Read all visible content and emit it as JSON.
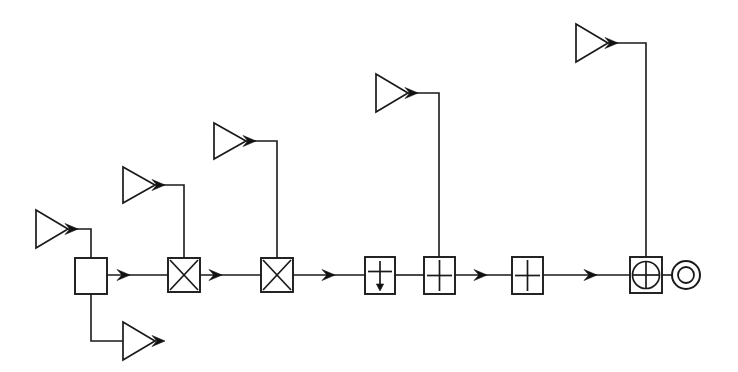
{
  "diagram": {
    "canvas": {
      "width": 738,
      "height": 372
    },
    "colors": {
      "background": "#ffffff",
      "line": "#1a1a1a",
      "arrow_fill": "#111111",
      "block_fill": "#ffffff"
    },
    "style": "line-art schematic, black on white, scanned appearance",
    "main_path_y": 275,
    "blocks": [
      {
        "id": "combiner",
        "name": "combiner-block",
        "symbol": "empty-square",
        "label": "",
        "x": 75,
        "y": 258,
        "w": 32,
        "h": 36,
        "inputs": [
          "top",
          "bottom"
        ],
        "outputs": [
          "right"
        ]
      },
      {
        "id": "mixer-1",
        "name": "mixer-block-1",
        "symbol": "cross-in-square",
        "label": "",
        "x": 168,
        "y": 258,
        "w": 32,
        "h": 34,
        "inputs": [
          "left",
          "top"
        ],
        "outputs": [
          "right"
        ]
      },
      {
        "id": "mixer-2",
        "name": "mixer-block-2",
        "symbol": "cross-in-square",
        "label": "",
        "x": 261,
        "y": 258,
        "w": 32,
        "h": 34,
        "inputs": [
          "left",
          "top"
        ],
        "outputs": [
          "right"
        ]
      },
      {
        "id": "decimator",
        "name": "downsampler-block",
        "symbol": "down-arrow-in-square",
        "label": "",
        "x": 365,
        "y": 257,
        "w": 30,
        "h": 37,
        "inputs": [
          "left"
        ],
        "outputs": [
          "right"
        ]
      },
      {
        "id": "adder-1",
        "name": "adder-block-1",
        "symbol": "plus-in-square",
        "label": "",
        "x": 424,
        "y": 257,
        "w": 31,
        "h": 37,
        "inputs": [
          "left",
          "top"
        ],
        "outputs": [
          "right"
        ]
      },
      {
        "id": "adder-2",
        "name": "adder-block-2",
        "symbol": "plus-in-square",
        "label": "",
        "x": 512,
        "y": 257,
        "w": 31,
        "h": 37,
        "inputs": [
          "left"
        ],
        "outputs": [
          "right"
        ]
      },
      {
        "id": "modulator",
        "name": "modulator-block",
        "symbol": "circle-cross-in-square",
        "label": "",
        "x": 630,
        "y": 257,
        "w": 32,
        "h": 36,
        "inputs": [
          "left",
          "top"
        ],
        "outputs": [
          "right"
        ]
      }
    ],
    "amplifiers": [
      {
        "id": "amp-1",
        "name": "amplifier-1",
        "symbol": "triangle-right",
        "label": "",
        "tip_x": 68,
        "tip_y": 229,
        "back_x": 36,
        "half_h": 19,
        "route": "right-then-down",
        "corner_x": 91,
        "target_y": 258
      },
      {
        "id": "amp-2",
        "name": "amplifier-2",
        "symbol": "triangle-right",
        "label": "",
        "tip_x": 155,
        "tip_y": 341,
        "back_x": 123,
        "half_h": 19,
        "route": "right-then-up",
        "corner_x": 91,
        "target_y": 294
      },
      {
        "id": "amp-3",
        "name": "amplifier-3",
        "symbol": "triangle-right",
        "label": "",
        "tip_x": 155,
        "tip_y": 185,
        "back_x": 123,
        "half_h": 18,
        "route": "right-then-down",
        "corner_x": 184,
        "target_y": 258
      },
      {
        "id": "amp-4",
        "name": "amplifier-4",
        "symbol": "triangle-right",
        "label": "",
        "tip_x": 246,
        "tip_y": 141,
        "back_x": 214,
        "half_h": 18,
        "route": "right-then-down",
        "corner_x": 277,
        "target_y": 258
      },
      {
        "id": "amp-5",
        "name": "amplifier-5",
        "symbol": "triangle-right",
        "label": "",
        "tip_x": 408,
        "tip_y": 93,
        "back_x": 376,
        "half_h": 19,
        "route": "right-then-down",
        "corner_x": 439,
        "target_y": 257
      },
      {
        "id": "amp-6",
        "name": "amplifier-6",
        "symbol": "triangle-right",
        "label": "",
        "tip_x": 608,
        "tip_y": 43,
        "back_x": 576,
        "half_h": 19,
        "route": "right-then-down",
        "corner_x": 646,
        "target_y": 257
      }
    ],
    "terminal": {
      "id": "output-terminal",
      "name": "output-terminal",
      "symbol": "concentric-double-circle",
      "label": "",
      "cx": 686,
      "cy": 275,
      "r_outer": 14,
      "r_inner": 8
    },
    "segments": [
      {
        "name": "wire-combiner-to-mixer1",
        "from": "combiner",
        "to": "mixer-1",
        "x1": 107,
        "x2": 168,
        "y": 275
      },
      {
        "name": "wire-mixer1-to-mixer2",
        "from": "mixer-1",
        "to": "mixer-2",
        "x1": 200,
        "x2": 261,
        "y": 275
      },
      {
        "name": "wire-mixer2-to-decimator",
        "from": "mixer-2",
        "to": "decimator",
        "x1": 293,
        "x2": 365,
        "y": 275
      },
      {
        "name": "wire-decimator-to-adder1",
        "from": "decimator",
        "to": "adder-1",
        "x1": 395,
        "x2": 424,
        "y": 275
      },
      {
        "name": "wire-adder1-to-adder2",
        "from": "adder-1",
        "to": "adder-2",
        "x1": 455,
        "x2": 512,
        "y": 275
      },
      {
        "name": "wire-adder2-to-modulator",
        "from": "adder-2",
        "to": "modulator",
        "x1": 543,
        "x2": 630,
        "y": 275
      },
      {
        "name": "wire-modulator-to-terminal",
        "from": "modulator",
        "to": "output-terminal",
        "x1": 662,
        "x2": 672,
        "y": 275
      }
    ],
    "arrow_markers": [
      {
        "name": "arrow-amp1-out",
        "x": 78,
        "y": 229
      },
      {
        "name": "arrow-amp2-out",
        "x": 165,
        "y": 341
      },
      {
        "name": "arrow-amp3-out",
        "x": 165,
        "y": 185
      },
      {
        "name": "arrow-amp4-out",
        "x": 256,
        "y": 141
      },
      {
        "name": "arrow-amp5-out",
        "x": 418,
        "y": 93
      },
      {
        "name": "arrow-amp6-out",
        "x": 618,
        "y": 43
      },
      {
        "name": "arrow-into-mixer1",
        "x": 130,
        "y": 275
      },
      {
        "name": "arrow-into-mixer2",
        "x": 222,
        "y": 275
      },
      {
        "name": "arrow-into-decimator",
        "x": 335,
        "y": 275
      },
      {
        "name": "arrow-into-adder2",
        "x": 487,
        "y": 275
      },
      {
        "name": "arrow-into-modulator",
        "x": 597,
        "y": 275
      }
    ]
  }
}
